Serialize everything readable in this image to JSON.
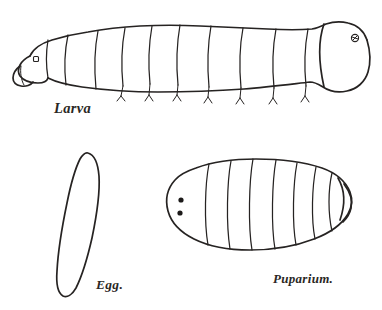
{
  "plate": {
    "title": "Insect life stages plate",
    "background_color": "#ffffff",
    "ink_color": "#262322",
    "style": "pen-and-ink line drawing"
  },
  "figures": [
    {
      "id": "larva",
      "label": "Larva",
      "description": "Lateral view of a fly maggot, head tapering to the left with mouth hooks, rounded terminal segment at right bearing a posterior spiracle",
      "segment_count": 11,
      "has_anterior_spiracle": true,
      "has_posterior_spiracle": true,
      "orientation": "head-left"
    },
    {
      "id": "egg",
      "label": "Egg.",
      "description": "Elongated narrow ovoid egg, tilted slightly, drawn in outline only",
      "orientation": "vertical"
    },
    {
      "id": "puparium",
      "label": "Puparium.",
      "description": "Dorsal view of barrel-shaped puparium with transverse segment lines and two dark anterior spiracles at the left end, tapering to a point at the right end",
      "segment_line_count": 7,
      "spiracle_dots": 2,
      "orientation": "anterior-left"
    }
  ],
  "labels": {
    "larva": "Larva",
    "egg": "Egg.",
    "puparium": "Puparium."
  }
}
